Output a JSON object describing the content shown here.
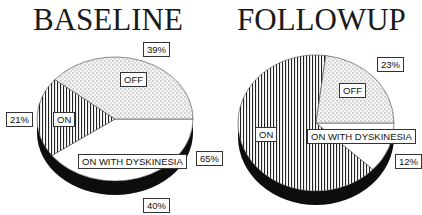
{
  "chart_data": [
    {
      "type": "pie",
      "title": "BASELINE",
      "slices": [
        {
          "label": "OFF",
          "value": 39,
          "value_label": "39%",
          "pattern": "dots"
        },
        {
          "label": "ON WITH DYSKINESIA",
          "value": 40,
          "value_label": "40%",
          "pattern": "white"
        },
        {
          "label": "ON",
          "value": 21,
          "value_label": "21%",
          "pattern": "vertical-stripes"
        }
      ],
      "style": "3d"
    },
    {
      "type": "pie",
      "title": "FOLLOWUP",
      "slices": [
        {
          "label": "OFF",
          "value": 23,
          "value_label": "23%",
          "pattern": "dots"
        },
        {
          "label": "ON WITH DYSKINESIA",
          "value": 12,
          "value_label": "12%",
          "pattern": "white"
        },
        {
          "label": "ON",
          "value": 65,
          "value_label": "65%",
          "pattern": "vertical-stripes"
        }
      ],
      "style": "3d"
    }
  ]
}
